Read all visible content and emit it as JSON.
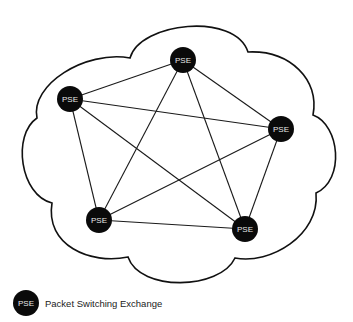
{
  "diagram": {
    "title": "",
    "type": "full-mesh network",
    "container": "cloud",
    "node_label": "PSE",
    "nodes": [
      {
        "id": "top",
        "label": "PSE"
      },
      {
        "id": "left",
        "label": "PSE"
      },
      {
        "id": "right",
        "label": "PSE"
      },
      {
        "id": "bottom-left",
        "label": "PSE"
      },
      {
        "id": "bottom-right",
        "label": "PSE"
      }
    ],
    "links": [
      [
        "top",
        "left"
      ],
      [
        "top",
        "right"
      ],
      [
        "top",
        "bottom-left"
      ],
      [
        "top",
        "bottom-right"
      ],
      [
        "left",
        "right"
      ],
      [
        "left",
        "bottom-left"
      ],
      [
        "left",
        "bottom-right"
      ],
      [
        "right",
        "bottom-left"
      ],
      [
        "right",
        "bottom-right"
      ],
      [
        "bottom-left",
        "bottom-right"
      ]
    ],
    "colors": {
      "node_fill": "#0a0a0a",
      "node_text": "#e8e8e8",
      "line": "#1a1a1a",
      "background": "#ffffff"
    }
  },
  "legend": {
    "symbol_label": "PSE",
    "description": "Packet Switching Exchange"
  }
}
